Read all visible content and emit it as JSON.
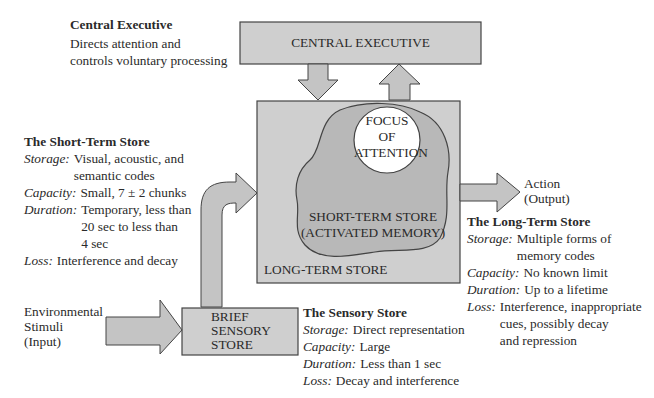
{
  "central_executive": {
    "title": "Central Executive",
    "desc_lines": [
      "Directs attention and",
      "controls voluntary processing"
    ],
    "box_label": "CENTRAL EXECUTIVE"
  },
  "long_term_box": {
    "label": "LONG-TERM STORE",
    "stm_label_lines": [
      "SHORT-TERM STORE",
      "(ACTIVATED MEMORY)"
    ],
    "focus_lines": [
      "FOCUS",
      "OF",
      "ATTENTION"
    ]
  },
  "sensory_box": {
    "label_lines": [
      "BRIEF",
      "SENSORY",
      "STORE"
    ]
  },
  "input": {
    "lines": [
      "Environmental",
      "Stimuli",
      "(Input)"
    ]
  },
  "output": {
    "lines": [
      "Action",
      "(Output)"
    ]
  },
  "short_term_store": {
    "title": "The Short-Term Store",
    "storage": {
      "label": "Storage:",
      "lines": [
        "Visual, acoustic, and",
        "semantic codes"
      ]
    },
    "capacity": {
      "label": "Capacity:",
      "lines": [
        "Small, 7 ± 2 chunks"
      ]
    },
    "duration": {
      "label": "Duration:",
      "lines": [
        "Temporary, less than",
        "20 sec to less than",
        "4 sec"
      ]
    },
    "loss": {
      "label": "Loss:",
      "lines": [
        "Interference and decay"
      ]
    }
  },
  "long_term_store": {
    "title": "The Long-Term Store",
    "storage": {
      "label": "Storage:",
      "lines": [
        "Multiple forms of",
        "memory codes"
      ]
    },
    "capacity": {
      "label": "Capacity:",
      "lines": [
        "No known limit"
      ]
    },
    "duration": {
      "label": "Duration:",
      "lines": [
        "Up to a lifetime"
      ]
    },
    "loss": {
      "label": "Loss:",
      "lines": [
        "Interference, inappropriate",
        "cues, possibly decay",
        "and repression"
      ]
    }
  },
  "sensory_store": {
    "title": "The Sensory Store",
    "storage": {
      "label": "Storage:",
      "lines": [
        "Direct representation"
      ]
    },
    "capacity": {
      "label": "Capacity:",
      "lines": [
        "Large"
      ]
    },
    "duration": {
      "label": "Duration:",
      "lines": [
        "Less than 1 sec"
      ]
    },
    "loss": {
      "label": "Loss:",
      "lines": [
        "Decay and interference"
      ]
    }
  },
  "colors": {
    "box_fill": "#cfcfcf",
    "blob_fill": "#b8b8b8",
    "circle_fill": "#ffffff",
    "stroke": "#444444"
  }
}
